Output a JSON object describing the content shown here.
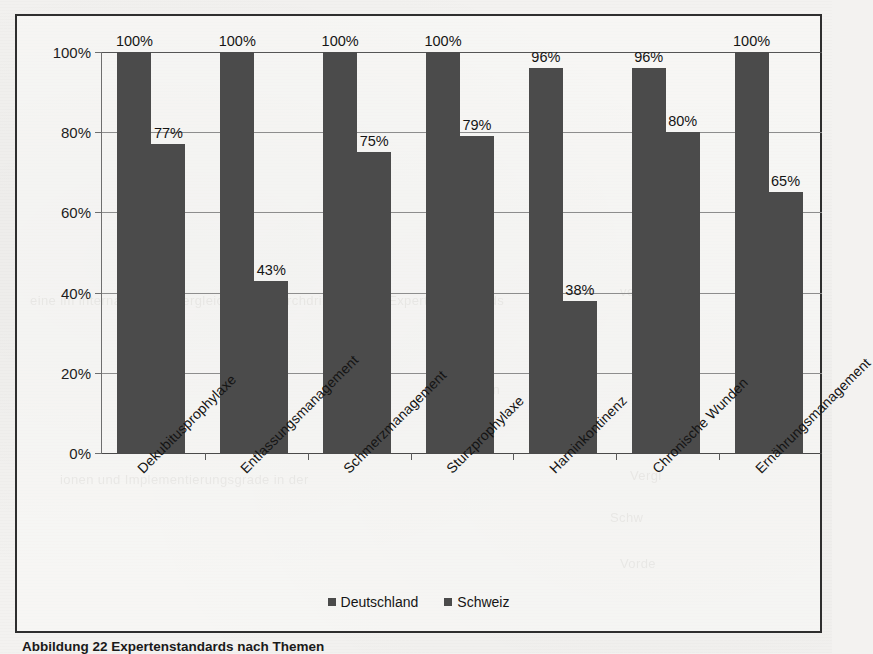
{
  "page": {
    "caption": "Abbildung 22 Expertenstandards nach Themen",
    "background_color": "#f3f2f0",
    "frame_color": "#2e2e2e"
  },
  "chart_data": {
    "type": "bar",
    "title": "",
    "subtitle": "",
    "xlabel": "",
    "ylabel": "",
    "ylim": [
      0,
      100
    ],
    "grid": true,
    "legend_position": "bottom",
    "bar_color": "#4b4b4b",
    "categories": [
      "Dekubitusprophylaxe",
      "Entlassungsmanagement",
      "Schmerzmanagement",
      "Sturzprophylaxe",
      "Harninkontinenz",
      "Chronische Wunden",
      "Ernährungsmanagement"
    ],
    "series": [
      {
        "name": "Deutschland",
        "values": [
          100,
          100,
          100,
          100,
          96,
          96,
          100
        ],
        "labels": [
          "100%",
          "100%",
          "100%",
          "100%",
          "96%",
          "96%",
          "100%"
        ]
      },
      {
        "name": "Schweiz",
        "values": [
          77,
          43,
          75,
          79,
          38,
          80,
          65
        ],
        "labels": [
          "77%",
          "43%",
          "75%",
          "79%",
          "38%",
          "80%",
          "65%"
        ]
      }
    ],
    "y_ticks": [
      0,
      20,
      40,
      60,
      80,
      100
    ],
    "y_tick_labels": [
      "0%",
      "20%",
      "40%",
      "60%",
      "80%",
      "100%"
    ]
  },
  "legend": {
    "items": [
      {
        "label": "Deutschland",
        "color": "#4b4b4b"
      },
      {
        "label": "Schweiz",
        "color": "#4b4b4b"
      }
    ]
  }
}
